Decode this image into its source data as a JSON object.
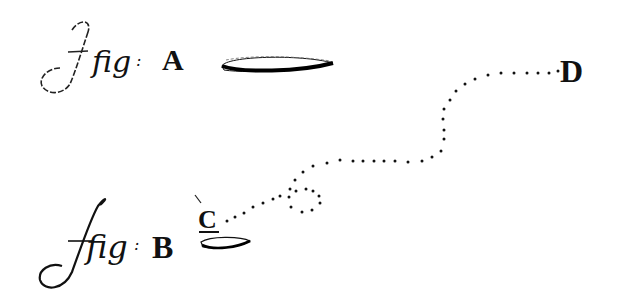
{
  "figure": {
    "fig_a": {
      "prefix": "fig",
      "separator": ":",
      "label": "A",
      "shape": "flattened-ellipse"
    },
    "fig_b": {
      "prefix": "fig",
      "separator": ":",
      "label": "B",
      "shape": "small-flattened-ellipse"
    },
    "point_c": {
      "label": "C"
    },
    "point_d": {
      "label": "D"
    },
    "path": {
      "style": "dotted",
      "description": "dotted trajectory from C forming a small loop, then meandering up to D",
      "color": "#111111"
    }
  }
}
